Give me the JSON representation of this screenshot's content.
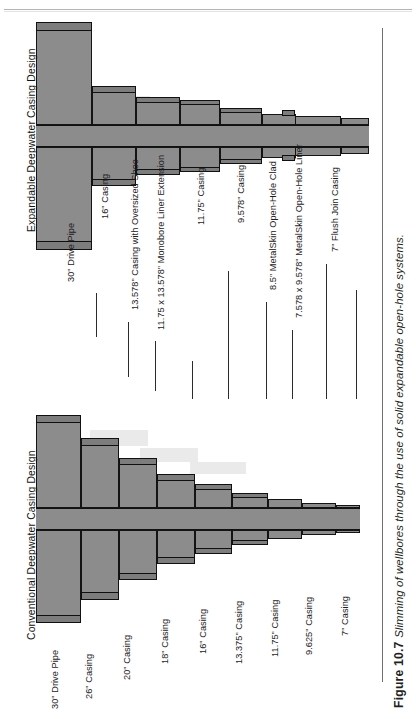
{
  "figure": {
    "number": "Figure 10.7",
    "caption": "Slimming of wellbores through the use of solid expandable open-hole systems."
  },
  "panels": [
    {
      "id": "expandable",
      "title": "Expandable Deepwater Casing Design",
      "labels": [
        "30\" Drive Pipe",
        "16\" Casing",
        "13.578\" Casing with Oversized Shoe",
        "11.75 x 13.578\" Monobore Liner Extension",
        "11.75\" Casing",
        "9.578\" Casing",
        "8.5\" MetalSkin Open-Hole Clad",
        "7.578 x 9.578\" MetalSkin Open-Hole Liner",
        "7\" Flush Join Casing"
      ]
    },
    {
      "id": "conventional",
      "title": "Conventional Deepwater Casing Design",
      "labels": [
        "30\" Drive Pipe",
        "26\" Casing",
        "20\" Casing",
        "18\" Casing",
        "16\" Casing",
        "13.375\" Casing",
        "11.75\" Casing",
        "9.625\" Casing",
        "7\" Casing"
      ]
    }
  ],
  "colors": {
    "fill": "#8c8c8c",
    "stroke": "#141414",
    "text": "#1c1c1c",
    "rule": "#6f6f6f"
  }
}
